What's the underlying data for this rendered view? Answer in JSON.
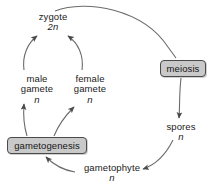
{
  "diagram": {
    "type": "cycle-diagram",
    "background_color": "#ffffff",
    "line_color": "#555555",
    "text_color": "#1a1a1a",
    "box_fill_color": "#c9c9c9",
    "box_border_color": "#4a4a4a",
    "nodes": [
      {
        "id": "zygote",
        "term": "zygote",
        "ploidy": "2n",
        "kind": "stage"
      },
      {
        "id": "male_gamete",
        "term": "male",
        "term2": "gamete",
        "ploidy": "n",
        "kind": "stage"
      },
      {
        "id": "female_gamete",
        "term": "female",
        "term2": "gamete",
        "ploidy": "n",
        "kind": "stage"
      },
      {
        "id": "gametogenesis",
        "term": "gametogenesis",
        "ploidy": "",
        "kind": "process"
      },
      {
        "id": "gametophyte",
        "term": "gametophyte",
        "ploidy": "n",
        "kind": "stage"
      },
      {
        "id": "spores",
        "term": "spores",
        "ploidy": "n",
        "kind": "stage"
      },
      {
        "id": "meiosis",
        "term": "meiosis",
        "ploidy": "",
        "kind": "process"
      }
    ],
    "edges": [
      {
        "from": "zygote",
        "to": "meiosis",
        "style": "curved",
        "arrowhead": false
      },
      {
        "from": "meiosis",
        "to": "spores",
        "style": "curved",
        "arrowhead": true
      },
      {
        "from": "spores",
        "to": "gametophyte",
        "style": "curved",
        "arrowhead": true
      },
      {
        "from": "gametophyte",
        "to": "gametogenesis",
        "style": "curved",
        "arrowhead": true
      },
      {
        "from": "gametogenesis",
        "to": "male_gamete",
        "style": "curved",
        "arrowhead": true
      },
      {
        "from": "gametogenesis",
        "to": "female_gamete",
        "style": "curved",
        "arrowhead": true
      },
      {
        "from": "male_gamete",
        "to": "zygote",
        "style": "curved",
        "arrowhead": true
      },
      {
        "from": "female_gamete",
        "to": "zygote",
        "style": "curved",
        "arrowhead": true
      }
    ]
  }
}
